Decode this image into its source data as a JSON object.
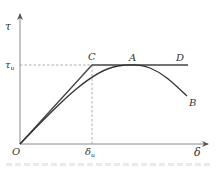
{
  "diagram": {
    "axes": {
      "y_label": "τ",
      "x_label": "δ",
      "origin_label": "O",
      "y_marker_label": "τ",
      "y_marker_sub": "u",
      "x_marker_label": "δ",
      "x_marker_sub": "u"
    },
    "points": {
      "C": "C",
      "A": "A",
      "D": "D",
      "B": "B"
    },
    "colors": {
      "axis": "#8a8a8a",
      "curve": "#333333",
      "dashed": "#9a9a9a"
    }
  }
}
